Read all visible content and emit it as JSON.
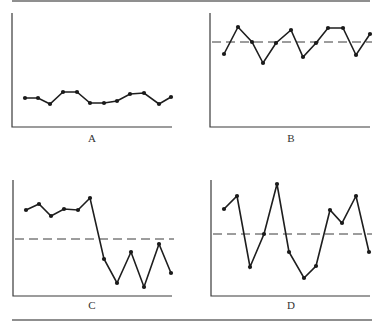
{
  "chart_data": [
    {
      "type": "line",
      "label": "A",
      "title": "A",
      "xlabel": "",
      "ylabel": "",
      "mean_line": null,
      "x": [
        1,
        2,
        3,
        4,
        5,
        6,
        7,
        8,
        9,
        10,
        11,
        12
      ],
      "values": [
        4.2,
        4.2,
        3.6,
        4.8,
        4.8,
        3.7,
        3.6,
        3.8,
        4.6,
        4.7,
        3.6,
        4.3
      ],
      "ylim": [
        0,
        15
      ],
      "grid": false,
      "pixels": {
        "axis_x": 12,
        "axis_top": 13,
        "axis_bottom": 127,
        "axis_right": 172,
        "points": [
          [
            25,
            98
          ],
          [
            38,
            98
          ],
          [
            50,
            104
          ],
          [
            63,
            92
          ],
          [
            77,
            92
          ],
          [
            90,
            103
          ],
          [
            104,
            103
          ],
          [
            117,
            101
          ],
          [
            130,
            94
          ],
          [
            144,
            93
          ],
          [
            159,
            104
          ],
          [
            171,
            97
          ]
        ]
      }
    },
    {
      "type": "line",
      "label": "B",
      "title": "B",
      "xlabel": "",
      "ylabel": "",
      "mean_line": 12.5,
      "x": [
        1,
        2,
        3,
        4,
        5,
        6,
        7,
        8,
        9,
        10,
        11,
        12
      ],
      "values": [
        11.5,
        14.0,
        12.5,
        10.5,
        12.5,
        13.8,
        11.3,
        12.5,
        14.0,
        14.0,
        11.4,
        13.2
      ],
      "ylim": [
        0,
        15
      ],
      "grid": false,
      "pixels": {
        "axis_x": 210,
        "axis_top": 13,
        "axis_bottom": 127,
        "axis_right": 370,
        "mean_y": 42,
        "points": [
          [
            224,
            54
          ],
          [
            238,
            27
          ],
          [
            252,
            42
          ],
          [
            263,
            63
          ],
          [
            276,
            43
          ],
          [
            291,
            30
          ],
          [
            303,
            57
          ],
          [
            316,
            43
          ],
          [
            328,
            28
          ],
          [
            343,
            28
          ],
          [
            356,
            55
          ],
          [
            370,
            34
          ]
        ]
      }
    },
    {
      "type": "line",
      "label": "C",
      "title": "C",
      "xlabel": "",
      "ylabel": "",
      "mean_line": 7.0,
      "x": [
        1,
        2,
        3,
        4,
        5,
        6,
        7,
        8,
        9,
        10,
        11,
        12
      ],
      "values": [
        10.0,
        10.6,
        9.6,
        10.1,
        10.0,
        11.1,
        4.2,
        1.5,
        5.0,
        1.0,
        5.8,
        2.6
      ],
      "ylim": [
        0,
        15
      ],
      "grid": false,
      "pixels": {
        "axis_x": 13,
        "axis_top": 180,
        "axis_bottom": 296,
        "axis_right": 172,
        "mean_y": 239,
        "points": [
          [
            26,
            210
          ],
          [
            39,
            204
          ],
          [
            51,
            216
          ],
          [
            64,
            209
          ],
          [
            78,
            210
          ],
          [
            90,
            198
          ],
          [
            104,
            259
          ],
          [
            117,
            283
          ],
          [
            131,
            252
          ],
          [
            144,
            287
          ],
          [
            159,
            244
          ],
          [
            171,
            273
          ]
        ]
      }
    },
    {
      "type": "line",
      "label": "D",
      "title": "D",
      "xlabel": "",
      "ylabel": "",
      "mean_line": 7.0,
      "x": [
        1,
        2,
        3,
        4,
        5,
        6,
        7,
        8,
        9,
        10,
        11,
        12
      ],
      "values": [
        10.0,
        11.5,
        3.5,
        7.0,
        12.5,
        5.0,
        2.2,
        3.5,
        9.8,
        8.5,
        11.5,
        5.0
      ],
      "ylim": [
        0,
        15
      ],
      "grid": false,
      "pixels": {
        "axis_x": 211,
        "axis_top": 180,
        "axis_bottom": 296,
        "axis_right": 370,
        "mean_y": 234,
        "points": [
          [
            224,
            209
          ],
          [
            237,
            196
          ],
          [
            250,
            267
          ],
          [
            264,
            234
          ],
          [
            277,
            184
          ],
          [
            289,
            252
          ],
          [
            304,
            278
          ],
          [
            316,
            266
          ],
          [
            330,
            210
          ],
          [
            342,
            223
          ],
          [
            356,
            196
          ],
          [
            369,
            252
          ]
        ]
      }
    }
  ],
  "labels": {
    "a": "A",
    "b": "B",
    "c": "C",
    "d": "D"
  },
  "colors": {
    "line": "#1e1e1e",
    "axis": "#3a3a3a",
    "rule": "#6a6a6a",
    "background": "#ffffff"
  }
}
